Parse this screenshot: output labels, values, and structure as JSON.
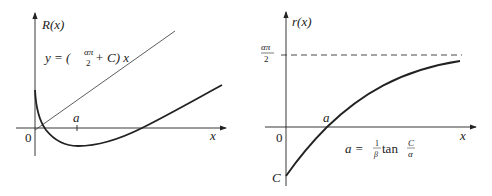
{
  "left_plot": {
    "y_axis_label": "R(x)",
    "x_axis_label": "x",
    "origin_label": "0",
    "tick_label": "a",
    "line_label": {
      "prefix": "y = (",
      "frac_num": "απ",
      "frac_den": "2",
      "suffix": " + C) x"
    }
  },
  "right_plot": {
    "y_axis_label": "r(x)",
    "x_axis_label": "x",
    "origin_label": "0",
    "intercept_label": "a",
    "y_intercept_label": "C",
    "asymptote_label": {
      "frac_num": "απ",
      "frac_den": "2"
    },
    "formula": {
      "lhs": "a = ",
      "frac1_num": "1",
      "frac1_den": "β",
      "func": " tan ",
      "frac2_num": "C",
      "frac2_den": "α"
    }
  },
  "colors": {
    "ink": "#222222",
    "background": "#ffffff"
  }
}
